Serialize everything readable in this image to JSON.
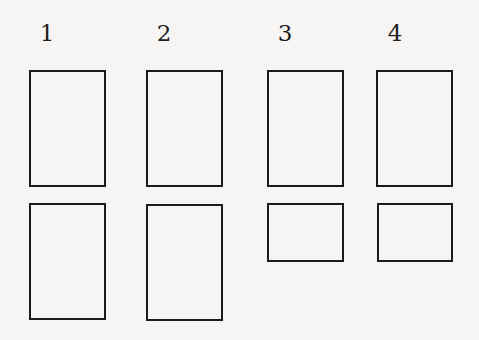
{
  "diagram": {
    "columns": [
      {
        "label": "1",
        "label_pos": {
          "x": 47,
          "y": 20
        },
        "boxes": [
          {
            "x": 29,
            "y": 70,
            "w": 77,
            "h": 117
          },
          {
            "x": 29,
            "y": 203,
            "w": 77,
            "h": 117
          }
        ]
      },
      {
        "label": "2",
        "label_pos": {
          "x": 164,
          "y": 20
        },
        "boxes": [
          {
            "x": 146,
            "y": 70,
            "w": 77,
            "h": 117
          },
          {
            "x": 146,
            "y": 204,
            "w": 77,
            "h": 117
          }
        ]
      },
      {
        "label": "3",
        "label_pos": {
          "x": 285,
          "y": 20
        },
        "boxes": [
          {
            "x": 267,
            "y": 70,
            "w": 77,
            "h": 117
          },
          {
            "x": 267,
            "y": 203,
            "w": 77,
            "h": 59
          }
        ]
      },
      {
        "label": "4",
        "label_pos": {
          "x": 395,
          "y": 20
        },
        "boxes": [
          {
            "x": 376,
            "y": 70,
            "w": 77,
            "h": 117
          },
          {
            "x": 377,
            "y": 203,
            "w": 76,
            "h": 59
          }
        ]
      }
    ]
  }
}
